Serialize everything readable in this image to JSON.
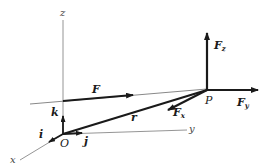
{
  "diagram": {
    "title": "",
    "axes": {
      "x": {
        "label": "x"
      },
      "y": {
        "label": "y"
      },
      "z": {
        "label": "z"
      }
    },
    "origin": {
      "label": "O"
    },
    "point": {
      "label": "P"
    },
    "unit_vectors": {
      "i": {
        "label": "i"
      },
      "j": {
        "label": "j"
      },
      "k": {
        "label": "k"
      }
    },
    "vectors": {
      "F": {
        "label": "F"
      },
      "r": {
        "label": "r"
      },
      "Fx": {
        "label": "F",
        "sub": "x"
      },
      "Fy": {
        "label": "F",
        "sub": "y"
      },
      "Fz": {
        "label": "F",
        "sub": "z"
      }
    },
    "colors": {
      "ink": "#1a1a1a",
      "axis": "#7a7a7a"
    }
  }
}
